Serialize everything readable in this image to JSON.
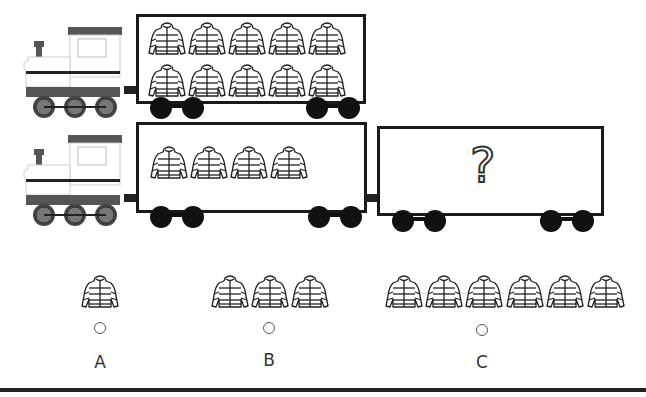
{
  "question": {
    "train1": {
      "car_jacket_count": 10,
      "rows": 2,
      "per_row": 5
    },
    "train2": {
      "car1_jacket_count": 4,
      "car2_content": "?"
    }
  },
  "options": [
    {
      "label": "A",
      "jacket_count": 1
    },
    {
      "label": "B",
      "jacket_count": 3
    },
    {
      "label": "C",
      "jacket_count": 6
    }
  ],
  "colors": {
    "engine_roof": "#555555",
    "engine_body": "#ffffff",
    "engine_base": "#5a5a5a",
    "car_border": "#1a1a1a",
    "wheel": "#111111"
  },
  "icons": {
    "jacket": "puffer-jacket-icon",
    "question": "question-mark-icon"
  }
}
